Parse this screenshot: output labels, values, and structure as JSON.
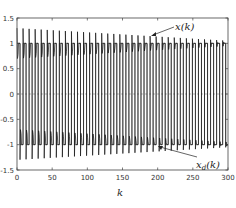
{
  "chart_data": {
    "type": "line",
    "title": "",
    "xlabel": "k",
    "ylabel": "",
    "xlim": [
      0,
      300
    ],
    "ylim": [
      -1.5,
      1.5
    ],
    "xticks": [
      0,
      50,
      100,
      150,
      200,
      250,
      300
    ],
    "yticks": [
      -1.5,
      -1,
      -0.5,
      0,
      0.5,
      1,
      1.5
    ],
    "xtick_labels": [
      "0",
      "50",
      "100",
      "150",
      "200",
      "250",
      "300"
    ],
    "ytick_labels": [
      "-1.5",
      "-1",
      "-0.5",
      "0",
      "0.5",
      "1",
      "1.5"
    ],
    "grid": false,
    "legend": null,
    "series": [
      {
        "name": "x(k)",
        "description": "Tracked state: square-wave-like response alternating sign with decaying overshoot peaks (about ±1.3 early, approaching ±1.05 by k=300) and intermediate dips near ±0.7 rising toward ±0.95",
        "period": 8.6,
        "peak_start": 1.3,
        "peak_end": 1.05,
        "dip_start": 0.7,
        "dip_end": 0.95
      },
      {
        "name": "x_d(k)",
        "description": "Desired trajectory: square wave between +1 and -1",
        "period": 8.6,
        "amplitude": 1
      }
    ],
    "annotations": [
      {
        "text": "x(k)",
        "arrow_to": [
          150,
          1.15
        ],
        "text_pos": [
          178,
          1.37
        ]
      },
      {
        "text": "x_d(k)",
        "arrow_to": [
          196,
          -1.0
        ],
        "text_pos": [
          210,
          -1.3
        ]
      }
    ]
  },
  "labels": {
    "x_annotation": "x(k)",
    "xd_annotation_main": "x",
    "xd_annotation_sub": "d",
    "xd_annotation_tail": "(k)",
    "xlabel": "k"
  },
  "colors": {
    "line": "#222222",
    "axis": "#333333",
    "background": "#ffffff"
  }
}
